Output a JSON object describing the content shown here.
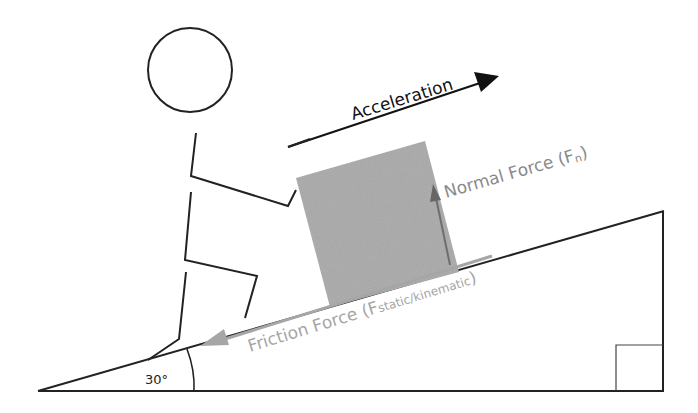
{
  "diagram": {
    "type": "free-body diagram of person pushing a block up an incline",
    "labels": {
      "acceleration": "Acceleration",
      "normal_force": "Normal Force (F",
      "normal_force_sub": "n",
      "normal_force_close": ")",
      "friction_force": "Friction Force (F",
      "friction_force_sub": "static/kinematic",
      "friction_force_close": ")",
      "angle": "30°"
    },
    "colors": {
      "line": "#222222",
      "block": "#a8a8a8",
      "normal_arrow": "#6e6e6e",
      "normal_text": "#8a8a8a",
      "friction": "#a6a6a6",
      "background": "#ffffff"
    },
    "incline_angle_deg": 30
  }
}
